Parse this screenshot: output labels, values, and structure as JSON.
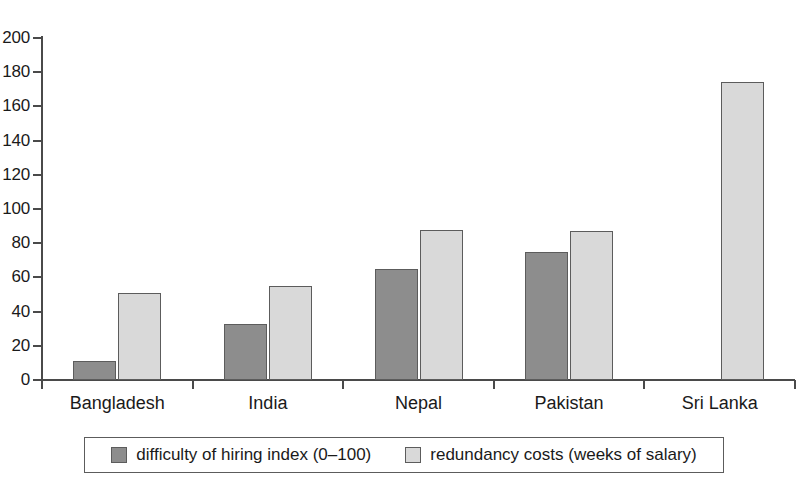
{
  "chart_data": {
    "type": "bar",
    "title": "",
    "subtitle": "",
    "xlabel": "",
    "ylabel": "",
    "ylim": [
      0,
      200
    ],
    "ytick_step": 20,
    "yticks": [
      0,
      20,
      40,
      60,
      80,
      100,
      120,
      140,
      160,
      180,
      200
    ],
    "grid": false,
    "legend_position": "bottom",
    "categories": [
      "Bangladesh",
      "India",
      "Nepal",
      "Pakistan",
      "Sri Lanka"
    ],
    "series": [
      {
        "name": "difficulty of hiring index (0–100)",
        "color": "#8d8d8d",
        "values": [
          11,
          33,
          65,
          75,
          0
        ]
      },
      {
        "name": "redundancy costs (weeks of salary)",
        "color": "#d9d9d9",
        "values": [
          51,
          55,
          88,
          87,
          174
        ]
      }
    ]
  },
  "legend": {
    "entries": [
      {
        "label": "difficulty of hiring index (0–100)",
        "swatch": "dark"
      },
      {
        "label": "redundancy costs (weeks of salary)",
        "swatch": "light"
      }
    ]
  },
  "colors": {
    "series_dark": "#8d8d8d",
    "series_light": "#d9d9d9",
    "axis": "#4a4a4a",
    "text": "#1a1a1a",
    "background": "#ffffff"
  }
}
